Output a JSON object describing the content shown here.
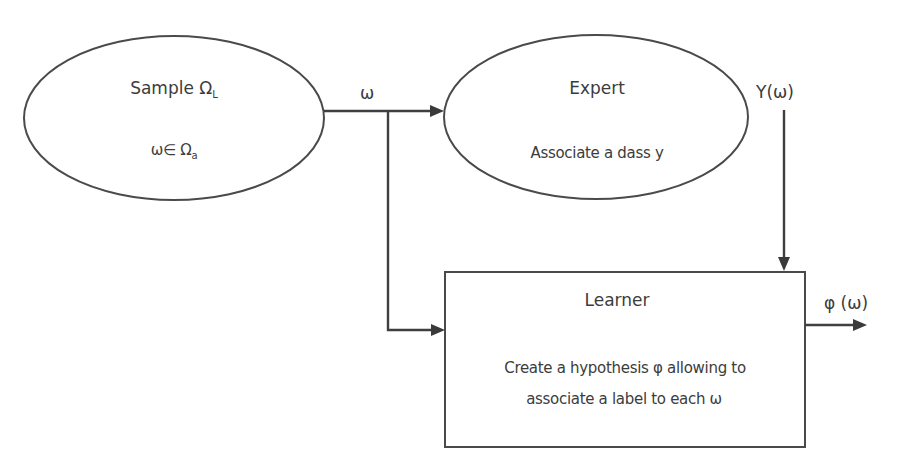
{
  "diagram": {
    "type": "flowchart",
    "colors": {
      "stroke": "#4a4a4a",
      "text": "#3c3c3c",
      "background": "#ffffff"
    },
    "nodes": {
      "sample": {
        "shape": "ellipse",
        "title": "Sample Ω",
        "title_sub": "L",
        "body": "ω∈ Ω",
        "body_sub": "a"
      },
      "expert": {
        "shape": "ellipse",
        "title": "Expert",
        "body": "Associate a dass y"
      },
      "learner": {
        "shape": "rectangle",
        "title": "Learner",
        "body_line1": "Create a hypothesis φ allowing to",
        "body_line2": "associate a label to each ω"
      }
    },
    "edges": [
      {
        "from": "sample",
        "to": "expert",
        "label": "ω"
      },
      {
        "from": "sample",
        "to": "learner",
        "label": ""
      },
      {
        "from": "expert",
        "to": "learner",
        "label": "Y(ω)"
      },
      {
        "from": "learner",
        "to": "output",
        "label": "φ (ω)"
      }
    ]
  }
}
